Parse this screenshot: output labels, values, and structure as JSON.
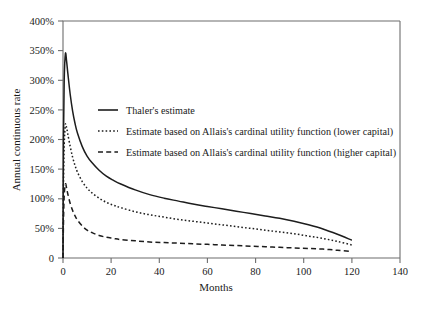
{
  "chart_data": {
    "type": "line",
    "title": "",
    "xlabel": "Months",
    "ylabel": "Annual continuous rate",
    "xlim": [
      0,
      140
    ],
    "ylim": [
      0,
      400
    ],
    "xticks": [
      0,
      20,
      40,
      60,
      80,
      100,
      120,
      140
    ],
    "xtick_labels": [
      "0",
      "20",
      "40",
      "60",
      "80",
      "100",
      "120",
      "140"
    ],
    "yticks": [
      0,
      50,
      100,
      150,
      200,
      250,
      300,
      350,
      400
    ],
    "ytick_labels": [
      "0",
      "50%",
      "100%",
      "150%",
      "200%",
      "250%",
      "300%",
      "350%",
      "400%"
    ],
    "grid": false,
    "legend_position": "upper-center-right",
    "x_unit": "months",
    "y_unit": "percent",
    "series": [
      {
        "name": "Thaler's estimate",
        "style": "solid",
        "color": "#1d1d1d",
        "x": [
          0.2,
          0.5,
          1,
          1.5,
          2,
          3,
          4,
          5,
          6,
          8,
          10,
          12,
          15,
          18,
          21,
          24,
          30,
          36,
          42,
          48,
          54,
          60,
          66,
          72,
          78,
          84,
          90,
          96,
          102,
          108,
          114,
          120
        ],
        "y": [
          200,
          300,
          345,
          332,
          312,
          276,
          248,
          227,
          211,
          188,
          172,
          161,
          148,
          138,
          131,
          125,
          115,
          107,
          101,
          96,
          91,
          87,
          83,
          79,
          75,
          71,
          67,
          62,
          56,
          49,
          40,
          30
        ]
      },
      {
        "name": "Estimate based on Allais's cardinal utility function (lower capital)",
        "style": "dotted",
        "color": "#1d1d1d",
        "x": [
          0.2,
          0.5,
          1,
          1.5,
          2,
          3,
          4,
          5,
          6,
          8,
          10,
          12,
          15,
          18,
          21,
          24,
          30,
          36,
          42,
          48,
          54,
          60,
          66,
          72,
          78,
          84,
          90,
          96,
          102,
          108,
          114,
          120
        ],
        "y": [
          120,
          190,
          225,
          220,
          209,
          188,
          170,
          156,
          145,
          129,
          118,
          110,
          101,
          94,
          89,
          85,
          78,
          73,
          69,
          65,
          62,
          59,
          56,
          53,
          50,
          47,
          44,
          41,
          37,
          33,
          28,
          22
        ]
      },
      {
        "name": "Estimate based on Allais's cardinal utility function (higher capital)",
        "style": "dashed",
        "color": "#1d1d1d",
        "x": [
          0.2,
          0.5,
          1,
          1.5,
          2,
          3,
          4,
          5,
          6,
          8,
          10,
          12,
          15,
          18,
          21,
          24,
          30,
          36,
          42,
          48,
          54,
          60,
          66,
          72,
          78,
          84,
          90,
          96,
          102,
          108,
          114,
          120
        ],
        "y": [
          60,
          105,
          125,
          118,
          108,
          92,
          80,
          71,
          64,
          54,
          47,
          43,
          38,
          35,
          33,
          31,
          29,
          27,
          26,
          25,
          24,
          23,
          22,
          21,
          20,
          19,
          18,
          17,
          16,
          15,
          13,
          11
        ]
      }
    ]
  },
  "axes": {
    "ylabel": "Annual continuous rate",
    "xlabel": "Months",
    "ytick_0": "0",
    "ytick_50": "50%",
    "ytick_100": "100%",
    "ytick_150": "150%",
    "ytick_200": "200%",
    "ytick_250": "250%",
    "ytick_300": "300%",
    "ytick_350": "350%",
    "ytick_400": "400%",
    "xtick_0": "0",
    "xtick_20": "20",
    "xtick_40": "40",
    "xtick_60": "60",
    "xtick_80": "80",
    "xtick_100": "100",
    "xtick_120": "120",
    "xtick_140": "140"
  },
  "legend": {
    "item_1": "Thaler's estimate",
    "item_2": "Estimate based on Allais's cardinal utility function (lower capital)",
    "item_3": "Estimate based on Allais's cardinal utility function (higher capital)"
  }
}
